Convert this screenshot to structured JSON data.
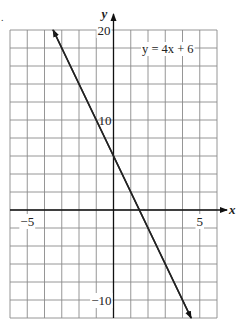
{
  "figure": {
    "bullet": "."
  },
  "chart_data": {
    "type": "line",
    "title": "",
    "equation_label": "y =   4x + 6",
    "xlabel": "x",
    "ylabel": "y",
    "xlim": [
      -6,
      6
    ],
    "ylim": [
      -12,
      20
    ],
    "x_ticks_labeled": [
      -5,
      5
    ],
    "y_ticks_labeled": [
      20,
      10,
      -10
    ],
    "x_tick_labels": [
      "−5",
      "5"
    ],
    "y_tick_labels": [
      "20",
      "10",
      "−10"
    ],
    "grid": true,
    "grid_step_x": 1,
    "grid_step_y": 2,
    "series": [
      {
        "name": "y = -4x + 6",
        "x": [
          -3.5,
          4.5
        ],
        "y": [
          20,
          -12
        ],
        "arrows": "both",
        "color": "#222222"
      }
    ],
    "legend": null
  }
}
